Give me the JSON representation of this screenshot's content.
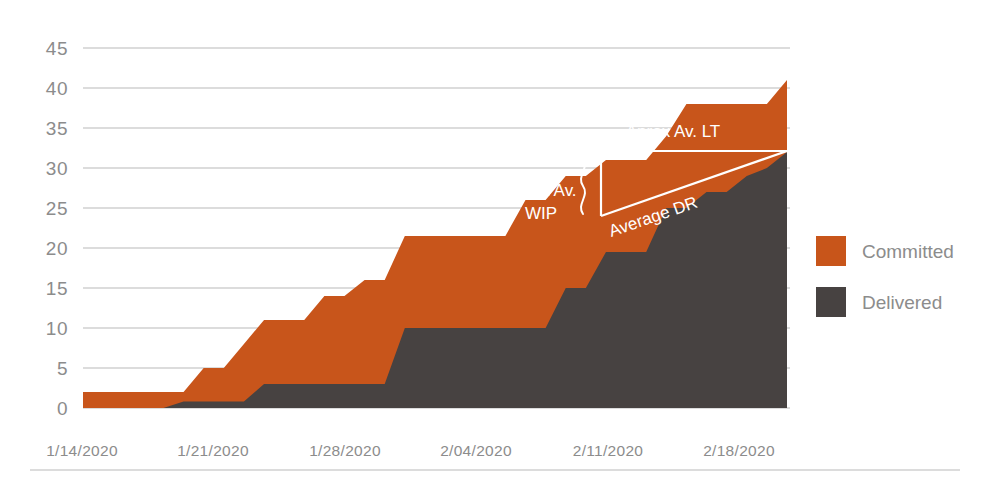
{
  "chart_data": {
    "type": "area",
    "title": "",
    "subtitle": "",
    "xlabel": "",
    "ylabel": "",
    "grid": true,
    "legend_position": "right",
    "ylim": [
      0,
      45
    ],
    "yticks": [
      0,
      5,
      10,
      15,
      20,
      25,
      30,
      35,
      40,
      45
    ],
    "ytick_labels": [
      "0",
      "5",
      "10",
      "15",
      "20",
      "25",
      "30",
      "35",
      "40",
      "45"
    ],
    "xtick_labels": [
      "1/14/2020",
      "1/21/2020",
      "1/28/2020",
      "2/04/2020",
      "2/11/2020",
      "2/18/2020"
    ],
    "x": [
      "1/14/2020",
      "1/15/2020",
      "1/16/2020",
      "1/17/2020",
      "1/18/2020",
      "1/19/2020",
      "1/20/2020",
      "1/21/2020",
      "1/22/2020",
      "1/23/2020",
      "1/24/2020",
      "1/25/2020",
      "1/26/2020",
      "1/27/2020",
      "1/28/2020",
      "1/29/2020",
      "1/30/2020",
      "1/31/2020",
      "2/01/2020",
      "2/02/2020",
      "2/03/2020",
      "2/04/2020",
      "2/05/2020",
      "2/06/2020",
      "2/07/2020",
      "2/08/2020",
      "2/09/2020",
      "2/10/2020",
      "2/11/2020",
      "2/12/2020",
      "2/13/2020",
      "2/14/2020",
      "2/15/2020",
      "2/16/2020",
      "2/17/2020",
      "2/18/2020"
    ],
    "series": [
      {
        "name": "Committed",
        "color": "#C8551B",
        "values": [
          2,
          2,
          2,
          2,
          2,
          2,
          5,
          5,
          8,
          11,
          11,
          11,
          14,
          14,
          16,
          16,
          21.5,
          21.5,
          21.5,
          21.5,
          21.5,
          21.5,
          26,
          26,
          29,
          29,
          31,
          31,
          31,
          34,
          38,
          38,
          38,
          38,
          38,
          41
        ]
      },
      {
        "name": "Delivered",
        "color": "#474241",
        "values": [
          0,
          0,
          0,
          0,
          0,
          0.8,
          0.8,
          0.8,
          0.8,
          3,
          3,
          3,
          3,
          3,
          3,
          3,
          10,
          10,
          10,
          10,
          10,
          10,
          10,
          10,
          15,
          15,
          19.5,
          19.5,
          19.5,
          25,
          25,
          27,
          27,
          29,
          30,
          32
        ]
      }
    ],
    "legend": [
      {
        "label": "Committed",
        "color": "#C8551A"
      },
      {
        "label": "Delivered",
        "color": "#474241"
      }
    ],
    "annotations": [
      {
        "name": "aprox-av-wip",
        "line1": "Aprox Av.",
        "line2": "WIP"
      },
      {
        "name": "aprox-av-lt",
        "text": "Aprox Av. LT"
      },
      {
        "name": "average-dr",
        "text": "Average DR"
      }
    ]
  },
  "colors": {
    "committed": "#C8551A",
    "delivered": "#474241",
    "grid": "#b9b9b9",
    "tick_text": "#8c8c8c",
    "annotation_text": "#ffffff",
    "background": "#ffffff"
  }
}
